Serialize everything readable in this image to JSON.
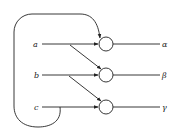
{
  "diagram": {
    "inputs": [
      {
        "label": "a",
        "y": 44
      },
      {
        "label": "b",
        "y": 75
      },
      {
        "label": "c",
        "y": 107
      }
    ],
    "outputs": [
      {
        "label": "α",
        "y": 44
      },
      {
        "label": "β",
        "y": 75
      },
      {
        "label": "γ",
        "y": 107
      }
    ],
    "nodes": [
      {
        "id": "node-1",
        "cx": 106,
        "cy": 44,
        "r": 7
      },
      {
        "id": "node-2",
        "cx": 106,
        "cy": 75,
        "r": 7
      },
      {
        "id": "node-3",
        "cx": 106,
        "cy": 107,
        "r": 7
      }
    ],
    "connections": [
      {
        "from": "a",
        "to": "node-1",
        "type": "direct"
      },
      {
        "from": "b",
        "to": "node-2",
        "type": "direct"
      },
      {
        "from": "c",
        "to": "node-3",
        "type": "direct"
      },
      {
        "from": "a",
        "to": "node-2",
        "type": "diagonal"
      },
      {
        "from": "b",
        "to": "node-3",
        "type": "diagonal"
      },
      {
        "from": "c",
        "to": "node-1",
        "type": "feedback-loop"
      },
      {
        "from": "node-1",
        "to": "α",
        "type": "output"
      },
      {
        "from": "node-2",
        "to": "β",
        "type": "output"
      },
      {
        "from": "node-3",
        "to": "γ",
        "type": "output"
      }
    ]
  }
}
